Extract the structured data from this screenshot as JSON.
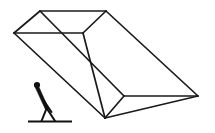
{
  "figure": {
    "title": "Person pushing an inclined open rectangular chute",
    "background_color": "#ffffff",
    "line_color": "#1a1a1a",
    "ground_color": "#111111",
    "person_color": "#111111",
    "width": 215,
    "height": 133,
    "labels": {
      "box": "open rectangular chute",
      "person": "stick figure person",
      "ground": "ground line"
    },
    "geometry": {
      "top_left_apex": [
        40,
        11
      ],
      "top_right_apex": [
        106,
        11
      ],
      "left_vertex": [
        14,
        33
      ],
      "mid_vertex": [
        83,
        33
      ],
      "inner_vertex": [
        124,
        96
      ],
      "right_vertex": [
        198,
        96
      ],
      "bottom_vertex": [
        105,
        118
      ],
      "lower_left_vertex": [
        72,
        118
      ]
    },
    "person": {
      "head_center": [
        37,
        85
      ],
      "head_radius": 3.1,
      "ground_y": 121,
      "ground_x_start": 28,
      "ground_x_end": 72
    }
  }
}
